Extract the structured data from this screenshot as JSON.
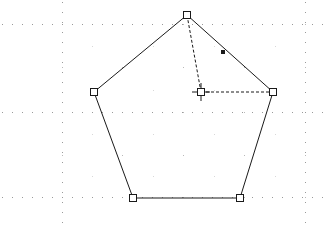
{
  "app": {
    "surface_name": "drawing-canvas",
    "width": 324,
    "height": 226,
    "background_color": "#ffffff"
  },
  "canvas": {
    "grid": {
      "visible": true,
      "dot_color": "#b9b9b9",
      "major_line_color": "#9a9a9a",
      "minor_spacing": 10,
      "major_spacing": 121,
      "minor_dot_size": 1,
      "major_dot_size": 1,
      "major_vertical_lines": [
        62,
        305
      ],
      "major_horizontal_lines": [
        24,
        112,
        197
      ],
      "sparse_dot_x": [
        62,
        122,
        183,
        244,
        305
      ],
      "sparse_dot_y": [
        24,
        67,
        112,
        155,
        197
      ]
    },
    "shape": {
      "name": "pentagon",
      "type": "regular-polygon",
      "sides": 5,
      "stroke_color": "#1a1a1a",
      "stroke_width": 1,
      "fill": "none",
      "center": {
        "x": 201,
        "y": 92
      },
      "circumradius": 77,
      "rotation_degrees": 0,
      "vertices": [
        {
          "id": "v-top",
          "label": "Vertex 1",
          "x": 187,
          "y": 15
        },
        {
          "id": "v-right",
          "label": "Vertex 2",
          "x": 273,
          "y": 92
        },
        {
          "id": "v-bottom-right",
          "label": "Vertex 3",
          "x": 240,
          "y": 198
        },
        {
          "id": "v-bottom-left",
          "label": "Vertex 4",
          "x": 133,
          "y": 198
        },
        {
          "id": "v-left",
          "label": "Vertex 5",
          "x": 94,
          "y": 92
        }
      ]
    },
    "handles": {
      "vertex_handle": {
        "style": "hollow-square",
        "size": 7,
        "stroke_color": "#1a1a1a",
        "fill_color": "#ffffff",
        "stroke_width": 1
      },
      "edge_handle": {
        "style": "filled-square",
        "size": 4,
        "fill_color": "#1a1a1a",
        "position": {
          "x": 223,
          "y": 52
        },
        "on_edge": "v-top to v-right"
      },
      "center_handle": {
        "style": "square-with-crosshair",
        "square_size": 7,
        "crosshair_length": 18,
        "stroke_color": "#1a1a1a",
        "position": {
          "x": 201,
          "y": 92
        }
      }
    },
    "construction_lines": [
      {
        "id": "radius-to-top",
        "style": "dashed",
        "dash_pattern": "3,2",
        "stroke_color": "#1a1a1a",
        "from": {
          "x": 201,
          "y": 92
        },
        "to": {
          "x": 187,
          "y": 15
        }
      },
      {
        "id": "radius-to-right",
        "style": "dashed",
        "dash_pattern": "3,2",
        "stroke_color": "#1a1a1a",
        "from": {
          "x": 201,
          "y": 92
        },
        "to": {
          "x": 273,
          "y": 92
        }
      }
    ]
  }
}
